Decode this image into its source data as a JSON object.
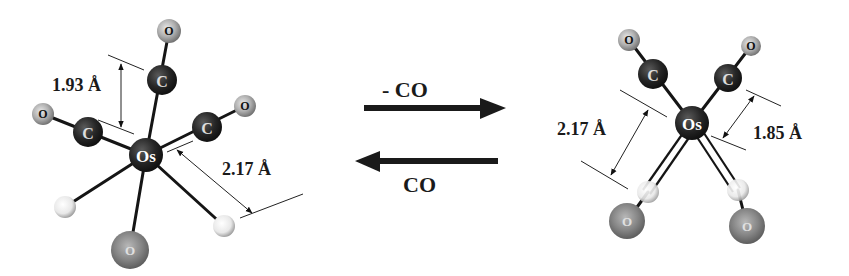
{
  "diagram": {
    "type": "chemical-reaction-scheme",
    "left_molecule": {
      "center_atom": "Os",
      "atoms": [
        {
          "id": "os",
          "label": "Os",
          "role": "metal"
        },
        {
          "id": "c_top",
          "label": "C"
        },
        {
          "id": "o_top",
          "label": "O"
        },
        {
          "id": "c_left",
          "label": "C"
        },
        {
          "id": "o_left",
          "label": "O"
        },
        {
          "id": "c_right",
          "label": "C"
        },
        {
          "id": "o_right",
          "label": "O"
        },
        {
          "id": "h_left",
          "label": ""
        },
        {
          "id": "h_right",
          "label": ""
        },
        {
          "id": "o_bottom",
          "label": "O"
        }
      ],
      "distances": [
        {
          "label": "1.93 Å",
          "between": "Os–C"
        },
        {
          "label": "2.17 Å",
          "between": "Os–O"
        }
      ]
    },
    "reaction": {
      "forward_label": "- CO",
      "reverse_label": "CO"
    },
    "right_molecule": {
      "center_atom": "Os",
      "atoms": [
        {
          "id": "os",
          "label": "Os",
          "role": "metal"
        },
        {
          "id": "c_tl",
          "label": "C"
        },
        {
          "id": "o_tl",
          "label": "O"
        },
        {
          "id": "c_tr",
          "label": "C"
        },
        {
          "id": "o_tr",
          "label": "O"
        },
        {
          "id": "h_bl",
          "label": ""
        },
        {
          "id": "o_bl",
          "label": "O"
        },
        {
          "id": "h_br",
          "label": ""
        },
        {
          "id": "o_br",
          "label": "O"
        }
      ],
      "distances": [
        {
          "label": "2.17 Å",
          "between": "Os–O"
        },
        {
          "label": "1.85 Å",
          "between": "Os–C"
        }
      ]
    }
  },
  "labels": {
    "os": "Os",
    "c": "C",
    "o": "O",
    "left_d1": "1.93 Å",
    "left_d2": "2.17 Å",
    "right_d1": "2.17 Å",
    "right_d2": "1.85 Å",
    "forward": "- CO",
    "reverse": "CO"
  },
  "colors": {
    "metal": "#1e1e1e",
    "carbon": "#2a2a2a",
    "oxygen_small": "#a8a8a8",
    "oxygen_large": "#7a7a7a",
    "hydrogen": "#e6e6e6",
    "bond": "#151515",
    "arrow": "#1a1a1a"
  }
}
